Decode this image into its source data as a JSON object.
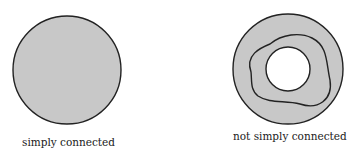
{
  "figure": {
    "left": {
      "label": "simply connected",
      "shape": "filled disk",
      "fill": "#c8c8c8",
      "stroke": "#222222"
    },
    "right": {
      "label": "not simply connected",
      "shape": "annulus with non-contractible loop",
      "fill": "#c8c8c8",
      "stroke": "#222222"
    }
  }
}
